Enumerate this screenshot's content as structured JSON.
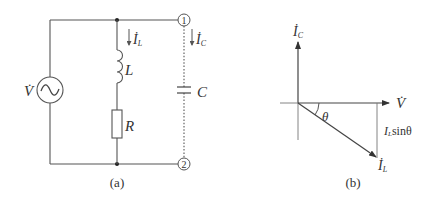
{
  "figure": {
    "panels": [
      {
        "id": "a",
        "caption": "(a)",
        "type": "circuit",
        "source": {
          "label": "V̇",
          "kind": "AC voltage source"
        },
        "branches": [
          {
            "current_label": "İ",
            "current_sub": "L",
            "components": [
              {
                "label": "L",
                "kind": "inductor"
              },
              {
                "label": "R",
                "kind": "resistor"
              }
            ]
          },
          {
            "current_label": "İ",
            "current_sub": "C",
            "components": [
              {
                "label": "C",
                "kind": "capacitor",
                "connection": "dashed"
              }
            ]
          }
        ],
        "nodes": [
          {
            "label": "1"
          },
          {
            "label": "2"
          }
        ]
      },
      {
        "id": "b",
        "caption": "(b)",
        "type": "phasor",
        "vectors": [
          {
            "label": "İ",
            "sub": "C",
            "direction": "up"
          },
          {
            "label": "V̇",
            "direction": "right"
          },
          {
            "label": "İ",
            "sub": "L",
            "direction": "down-right",
            "angle_label": "θ"
          }
        ],
        "projection_label": {
          "main": "I",
          "sub": "L",
          "rest": "sinθ"
        }
      }
    ]
  }
}
